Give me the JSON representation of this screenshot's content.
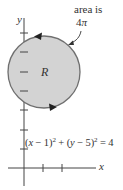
{
  "figure": {
    "axes": {
      "x_label": "x",
      "y_label": "y",
      "origin_px": [
        24,
        168
      ],
      "unit_px": 19,
      "x_ticks": [
        1,
        2
      ],
      "y_ticks": [
        1,
        2,
        3,
        4,
        5,
        6,
        7
      ]
    },
    "region": {
      "label": "R",
      "center": [
        1,
        5
      ],
      "radius": 2,
      "fill_color": "#d3d3d3",
      "stroke_color": "#6f6f6f",
      "orientation": "counterclockwise"
    },
    "annotation": {
      "line1": "area is",
      "line2_num": "4",
      "line2_sym": "π"
    },
    "equation": {
      "part1": "(",
      "x": "x",
      "part2": " − 1)",
      "exp1": "2",
      "part3": " + (",
      "y": "y",
      "part4": " − 5)",
      "exp2": "2",
      "part5": " = 4"
    }
  }
}
